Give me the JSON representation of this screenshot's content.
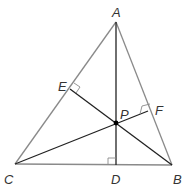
{
  "diagram": {
    "type": "triangle-orthocenter",
    "colors": {
      "sides": "#8a8a8a",
      "altitudes": "#222222",
      "labels": "#333333",
      "background": "#ffffff"
    },
    "vertices": {
      "A": {
        "label": "A",
        "x": 116,
        "y": 22
      },
      "B": {
        "label": "B",
        "x": 172,
        "y": 165
      },
      "C": {
        "label": "C",
        "x": 15,
        "y": 164
      }
    },
    "feet": {
      "D": {
        "label": "D",
        "x": 116,
        "y": 165
      },
      "E": {
        "label": "E",
        "x": 70,
        "y": 89
      },
      "F": {
        "label": "F",
        "x": 148,
        "y": 111
      }
    },
    "intersection": {
      "label": "P",
      "x": 116,
      "y": 123
    },
    "right_angle_marks": [
      "D",
      "E",
      "F"
    ],
    "segments": [
      "AB",
      "BC",
      "CA",
      "AD",
      "BE",
      "CF"
    ]
  }
}
